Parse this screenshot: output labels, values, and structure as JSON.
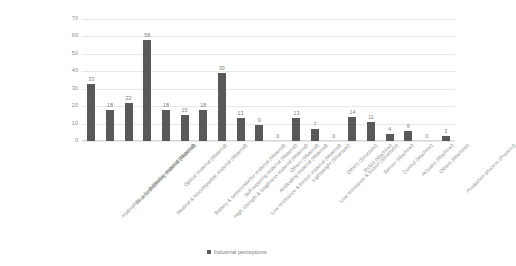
{
  "chart_data": {
    "type": "bar",
    "title": "",
    "xlabel": "",
    "ylabel": "",
    "ylim": [
      0,
      70
    ],
    "y_ticks": [
      70,
      60,
      50,
      40,
      30,
      20,
      10,
      0
    ],
    "grid": true,
    "legend_position": "bottom",
    "series": [
      {
        "name": "Industrial perceptions",
        "color": "#595959",
        "values": [
          33,
          18,
          22,
          58,
          18,
          15,
          18,
          39,
          13,
          9,
          0,
          13,
          7,
          0,
          14,
          11,
          4,
          6,
          0,
          3
        ]
      }
    ],
    "categories": [
      "Hydrophilic & hydrophobic material (Material)",
      "Structural coloring material (Material)",
      "Adhesive material (Material)",
      "Medical & biocompatible material (Material)",
      "Optical material (Material)",
      "Battery & semiconductor material (Material)",
      "High strength & toughness material (Material)",
      "Self-repairing material (Material)",
      "Low resistance & friction material (Material)",
      "Antifouling material (Material)",
      "Others (Material)",
      "Lightweight (Structure)",
      "Low resistance & friction (Structure)",
      "Others (Structure)",
      "Robot (Machine)",
      "Sensor (Machine)",
      "Control (Machine)",
      "Actuator (Machine)",
      "Others (Machine)",
      "Production process (Process)"
    ]
  },
  "legend": {
    "items": [
      {
        "label": "Industrial perceptions",
        "color": "#595959"
      }
    ]
  },
  "colors": {
    "bar": "#595959",
    "gridline": "#e8e8e8",
    "text": "#808080",
    "background": "#ffffff"
  }
}
